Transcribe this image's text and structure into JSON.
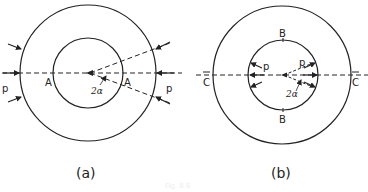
{
  "figure": {
    "caption": "Fig. 8.6",
    "panels": [
      {
        "id": "a",
        "label": "(a)",
        "point_labels": {
          "left": "A",
          "right": "A"
        },
        "pressure_labels": {
          "left": "p",
          "right": "p"
        },
        "angle_label": "2α",
        "description": "Ring loaded by external pressure p over arcs at A"
      },
      {
        "id": "b",
        "label": "(b)",
        "point_labels": {
          "top": "B",
          "bottom": "B",
          "left": "C",
          "right": "C"
        },
        "pressure_labels": {
          "left": "p",
          "right": "p"
        },
        "angle_label": "2α",
        "description": "Ring loaded by internal pressure p over arcs"
      }
    ]
  }
}
